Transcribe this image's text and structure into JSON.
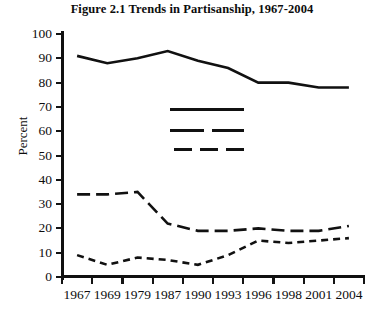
{
  "chart_data": {
    "type": "line",
    "title": "Figure 2.1 Trends in Partisanship, 1967-2004",
    "xlabel": "",
    "ylabel": "Percent",
    "ylim": [
      0,
      100
    ],
    "ytick_step": 10,
    "yticks": [
      "100",
      "90",
      "80",
      "70",
      "60",
      "50",
      "40",
      "30",
      "20",
      "10",
      "0"
    ],
    "grid": false,
    "legend_position": "center-upper-inside",
    "legend_has_labels": false,
    "categories": [
      "1967",
      "1969",
      "1979",
      "1987",
      "1990",
      "1993",
      "1996",
      "1998",
      "2001",
      "2004"
    ],
    "series": [
      {
        "name": "series-1",
        "style": "solid",
        "color": "#111111",
        "values": [
          91,
          88,
          90,
          93,
          89,
          86,
          80,
          80,
          78,
          78
        ]
      },
      {
        "name": "series-2",
        "style": "long-dash",
        "color": "#111111",
        "values": [
          34,
          34,
          35,
          22,
          19,
          19,
          20,
          19,
          19,
          21
        ]
      },
      {
        "name": "series-3",
        "style": "short-dash",
        "color": "#111111",
        "values": [
          9,
          5,
          8,
          7,
          5,
          9,
          15,
          14,
          15,
          16
        ]
      }
    ]
  },
  "legend": {
    "items": [
      {
        "style_name": "solid-line-swatch",
        "style": "solid"
      },
      {
        "style_name": "long-dash-line-swatch",
        "style": "long-dash"
      },
      {
        "style_name": "short-dash-line-swatch",
        "style": "short-dash"
      }
    ]
  }
}
